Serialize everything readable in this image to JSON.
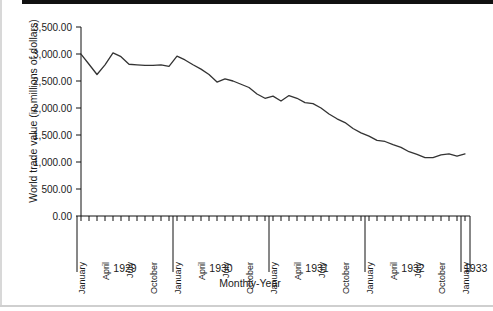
{
  "chart_data": {
    "type": "line",
    "title": "",
    "xlabel": "Monthly-Year",
    "ylabel": "World trade value (in millions of dollars)",
    "ylim": [
      0,
      3500
    ],
    "ytick_labels": [
      "0.00",
      "500.00",
      "1,000.00",
      "1,500.00",
      "2,000.00",
      "2,500.00",
      "3,000.00",
      "3,500.00"
    ],
    "ytick_values": [
      0,
      500,
      1000,
      1500,
      2000,
      2500,
      3000,
      3500
    ],
    "grid": false,
    "legend": "none",
    "year_groups": [
      "1929",
      "1930",
      "1931",
      "1932",
      "1933"
    ],
    "month_tick_labels": [
      "January",
      "April",
      "July",
      "October"
    ],
    "labeled_months": [
      1,
      4,
      7,
      10
    ],
    "x": [
      "January 1929",
      "February 1929",
      "March 1929",
      "April 1929",
      "May 1929",
      "June 1929",
      "July 1929",
      "August 1929",
      "September 1929",
      "October 1929",
      "November 1929",
      "December 1929",
      "January 1930",
      "February 1930",
      "March 1930",
      "April 1930",
      "May 1930",
      "June 1930",
      "July 1930",
      "August 1930",
      "September 1930",
      "October 1930",
      "November 1930",
      "December 1930",
      "January 1931",
      "February 1931",
      "March 1931",
      "April 1931",
      "May 1931",
      "June 1931",
      "July 1931",
      "August 1931",
      "September 1931",
      "October 1931",
      "November 1931",
      "December 1931",
      "January 1932",
      "February 1932",
      "March 1932",
      "April 1932",
      "May 1932",
      "June 1932",
      "July 1932",
      "August 1932",
      "September 1932",
      "October 1932",
      "November 1932",
      "December 1932",
      "January 1933"
    ],
    "values": [
      2998,
      2810,
      2620,
      2800,
      3020,
      2950,
      2810,
      2800,
      2790,
      2790,
      2800,
      2770,
      2960,
      2890,
      2800,
      2720,
      2620,
      2480,
      2540,
      2500,
      2440,
      2380,
      2260,
      2180,
      2220,
      2130,
      2230,
      2180,
      2100,
      2080,
      2000,
      1890,
      1800,
      1730,
      1620,
      1540,
      1480,
      1400,
      1380,
      1320,
      1270,
      1190,
      1140,
      1080,
      1080,
      1130,
      1150,
      1110,
      1150
    ]
  }
}
